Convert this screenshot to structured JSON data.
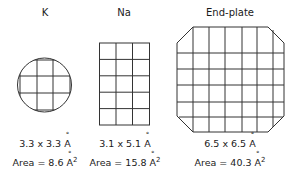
{
  "panels": [
    {
      "title": "K",
      "dims": "3.3 x 3.3",
      "area_label": "Area = 8.6",
      "unit": "A",
      "exp": "2"
    },
    {
      "title": "Na",
      "dims": "3.1 x 5.1",
      "area_label": "Area = 15.8",
      "unit": "A",
      "exp": "2"
    },
    {
      "title": "End-plate",
      "dims": "6.5 x 6.5",
      "area_label": "Area = 40.3",
      "unit": "A",
      "exp": "2"
    }
  ]
}
